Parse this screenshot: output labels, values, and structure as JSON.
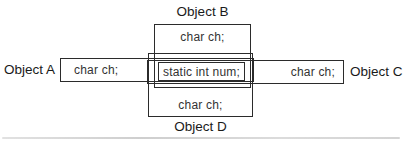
{
  "diagram": {
    "objects": {
      "a": {
        "label": "Object A",
        "member": "char ch;"
      },
      "b": {
        "label": "Object B",
        "member": "char ch;"
      },
      "c": {
        "label": "Object C",
        "member": "char ch;"
      },
      "d": {
        "label": "Object D",
        "member": "char ch;"
      }
    },
    "shared": {
      "member": "static int num;"
    },
    "colors": {
      "line": "#2b2b2b",
      "text": "#222222",
      "background": "#ffffff"
    }
  }
}
